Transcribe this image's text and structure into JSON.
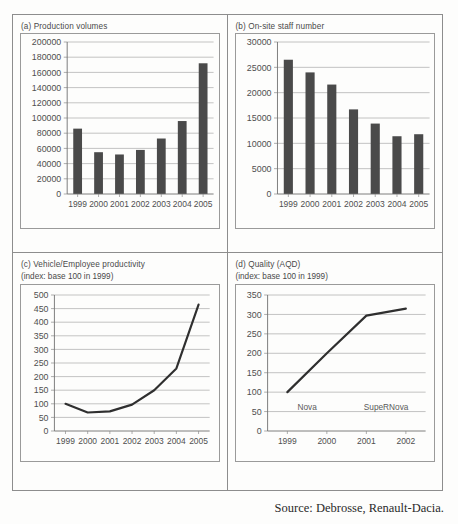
{
  "figure": {
    "source": "Source: Debrosse, Renault-Dacia."
  },
  "panels": {
    "a": {
      "title": "(a) Production volumes",
      "subtitle": ""
    },
    "b": {
      "title": "(b) On-site staff number",
      "subtitle": ""
    },
    "c": {
      "title": "(c) Vehicle/Employee productivity",
      "subtitle": "(index: base 100 in 1999)"
    },
    "d": {
      "title": "(d) Quality (AQD)",
      "subtitle": "(index: base 100 in 1999)"
    }
  },
  "chart_data": [
    {
      "id": "a",
      "type": "bar",
      "title": "(a) Production volumes",
      "xlabel": "",
      "ylabel": "",
      "categories": [
        "1999",
        "2000",
        "2001",
        "2002",
        "2003",
        "2004",
        "2005"
      ],
      "values": [
        86000,
        55000,
        52000,
        58000,
        73000,
        96000,
        172000
      ],
      "ylim": [
        0,
        200000
      ],
      "yticks": [
        0,
        20000,
        40000,
        60000,
        80000,
        100000,
        120000,
        140000,
        160000,
        180000,
        200000
      ],
      "ytick_labels": [
        "0",
        "20000",
        "40000",
        "60000",
        "80000",
        "100000",
        "120000",
        "140000",
        "160000",
        "180000",
        "200000"
      ],
      "grid": true,
      "legend": false,
      "bar_color": "#4a4a4a"
    },
    {
      "id": "b",
      "type": "bar",
      "title": "(b) On-site staff number",
      "xlabel": "",
      "ylabel": "",
      "categories": [
        "1999",
        "2000",
        "2001",
        "2002",
        "2003",
        "2004",
        "2005"
      ],
      "values": [
        26500,
        24000,
        21600,
        16700,
        13900,
        11400,
        11800
      ],
      "ylim": [
        0,
        30000
      ],
      "yticks": [
        0,
        5000,
        10000,
        15000,
        20000,
        25000,
        30000
      ],
      "ytick_labels": [
        "0",
        "5000",
        "10000",
        "15000",
        "20000",
        "25000",
        "30000"
      ],
      "grid": true,
      "legend": false,
      "bar_color": "#4a4a4a"
    },
    {
      "id": "c",
      "type": "line",
      "title": "(c) Vehicle/Employee productivity",
      "subtitle": "(index: base 100 in 1999)",
      "xlabel": "",
      "ylabel": "",
      "categories": [
        "1999",
        "2000",
        "2001",
        "2002",
        "2003",
        "2004",
        "2005"
      ],
      "values": [
        100,
        68,
        72,
        97,
        150,
        230,
        465
      ],
      "ylim": [
        0,
        500
      ],
      "yticks": [
        0,
        50,
        100,
        150,
        200,
        250,
        300,
        350,
        400,
        450,
        500
      ],
      "ytick_labels": [
        "0",
        "50",
        "100",
        "150",
        "200",
        "250",
        "300",
        "350",
        "400",
        "450",
        "500"
      ],
      "grid": true,
      "legend": false,
      "line_color": "#2f2f2f"
    },
    {
      "id": "d",
      "type": "line",
      "title": "(d) Quality (AQD)",
      "subtitle": "(index: base 100 in 1999)",
      "xlabel": "",
      "ylabel": "",
      "categories": [
        "1999",
        "2000",
        "2001",
        "2002"
      ],
      "values": [
        100,
        200,
        297,
        315
      ],
      "ylim": [
        0,
        350
      ],
      "yticks": [
        0,
        50,
        100,
        150,
        200,
        250,
        300,
        350
      ],
      "ytick_labels": [
        "0",
        "50",
        "100",
        "150",
        "200",
        "250",
        "300",
        "350"
      ],
      "grid": true,
      "legend": false,
      "line_color": "#2f2f2f",
      "annotations": [
        {
          "text": "Nova",
          "x": "1999-2000",
          "y": 55
        },
        {
          "text": "SupeRNova",
          "x": "2001-2002",
          "y": 55
        }
      ]
    }
  ]
}
